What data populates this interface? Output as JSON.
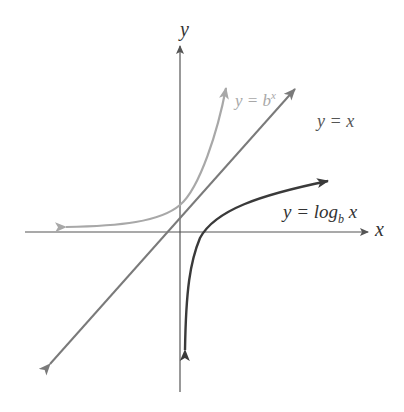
{
  "diagram": {
    "axes": {
      "x_label": "x",
      "y_label": "y"
    },
    "curves": [
      {
        "name": "exponential",
        "label_prefix": "y = b",
        "label_sup": "x",
        "color": "#a8a8a8"
      },
      {
        "name": "identity",
        "label": "y = x",
        "color": "#7a7a7a"
      },
      {
        "name": "logarithm",
        "label_prefix": "y = log",
        "label_sub": "b",
        "label_suffix": " x",
        "color": "#3a3a3a"
      }
    ],
    "colors": {
      "axes": "#555555",
      "background": "#ffffff"
    }
  }
}
